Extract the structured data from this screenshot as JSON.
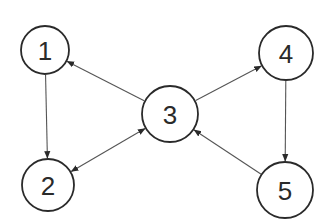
{
  "diagram": {
    "type": "directed-graph",
    "nodes": [
      {
        "id": "1",
        "label": "1",
        "cx": 45,
        "cy": 50,
        "r": 24
      },
      {
        "id": "2",
        "label": "2",
        "cx": 48,
        "cy": 185,
        "r": 26
      },
      {
        "id": "3",
        "label": "3",
        "cx": 170,
        "cy": 114,
        "r": 28
      },
      {
        "id": "4",
        "label": "4",
        "cx": 286,
        "cy": 53,
        "r": 27
      },
      {
        "id": "5",
        "label": "5",
        "cx": 285,
        "cy": 190,
        "r": 28
      }
    ],
    "edges": [
      {
        "from": "1",
        "to": "2",
        "bidirectional": false
      },
      {
        "from": "3",
        "to": "1",
        "bidirectional": false
      },
      {
        "from": "2",
        "to": "3",
        "bidirectional": true
      },
      {
        "from": "3",
        "to": "4",
        "bidirectional": false
      },
      {
        "from": "4",
        "to": "5",
        "bidirectional": false
      },
      {
        "from": "5",
        "to": "3",
        "bidirectional": false
      }
    ],
    "colors": {
      "stroke": "#2a2a2a",
      "edge": "#555555",
      "background": "#ffffff"
    }
  }
}
